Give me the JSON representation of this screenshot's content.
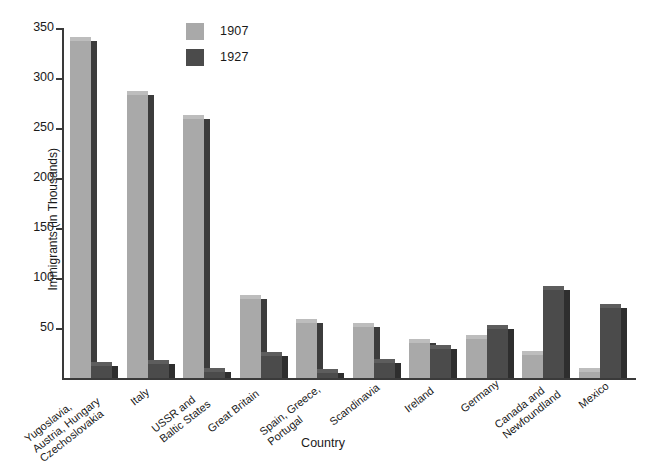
{
  "chart_data": {
    "type": "bar",
    "title": "",
    "xlabel": "Country",
    "ylabel": "Immigrants (in Thousands)",
    "ylim": [
      0,
      350
    ],
    "yticks": [
      0,
      50,
      100,
      150,
      200,
      250,
      300,
      350
    ],
    "ytick_labels": [
      "",
      "50",
      "100",
      "150",
      "200",
      "250",
      "300",
      "350"
    ],
    "grid": false,
    "legend_position": "top-left-inside",
    "categories": [
      "Yugoslavia, Austria, Hungary, Czechoslovakia",
      "Italy",
      "USSR and Baltic States",
      "Great Britain",
      "Spain, Greece, Portugal",
      "Scandinavia",
      "Ireland",
      "Germany",
      "Canada and Newfoundland",
      "Mexico"
    ],
    "category_lines": [
      [
        "Yugoslavia,",
        "Austria, Hungary",
        "Czechoslovakia"
      ],
      [
        "Italy"
      ],
      [
        "USSR and",
        "Baltic States"
      ],
      [
        "Great Britain"
      ],
      [
        "Spain, Greece,",
        "Portugal"
      ],
      [
        "Scandinavia"
      ],
      [
        "Ireland"
      ],
      [
        "Germany"
      ],
      [
        "Canada and",
        "Newfoundland"
      ],
      [
        "Mexico"
      ]
    ],
    "series": [
      {
        "name": "1907",
        "color": "#a9a9a9",
        "values": [
          337,
          283,
          259,
          79,
          55,
          51,
          35,
          39,
          23,
          6
        ]
      },
      {
        "name": "1927",
        "color": "#4b4b4b",
        "values": [
          12,
          14,
          6,
          22,
          5,
          15,
          29,
          49,
          88,
          70
        ]
      }
    ]
  },
  "legend": {
    "items": [
      {
        "label": "1907",
        "color": "#a9a9a9"
      },
      {
        "label": "1927",
        "color": "#4b4b4b"
      }
    ]
  },
  "axes": {
    "y_title": "Immigrants (in Thousands)",
    "x_title": "Country"
  }
}
